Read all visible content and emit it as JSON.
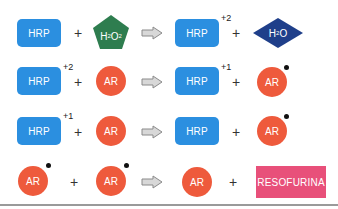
{
  "colors": {
    "hrp": "#2b8fe0",
    "ar": "#ee5a3c",
    "h2o2": "#2e7d4f",
    "h2o": "#1f3f8a",
    "resofurina": "#e8507a",
    "arrow": "#b0b0b0"
  },
  "reactions": [
    {
      "reactants": [
        {
          "type": "HRP",
          "label": "HRP",
          "charge": ""
        },
        {
          "type": "H2O2",
          "label": "H",
          "sub1": "2",
          "label2": "O",
          "sub2": "2"
        }
      ],
      "products": [
        {
          "type": "HRP",
          "label": "HRP",
          "charge": "+2"
        },
        {
          "type": "H2O",
          "label": "H",
          "sub1": "2",
          "label2": "O"
        }
      ],
      "plus": "+"
    },
    {
      "reactants": [
        {
          "type": "HRP",
          "label": "HRP",
          "charge": "+2"
        },
        {
          "type": "AR",
          "label": "AR",
          "radical": false
        }
      ],
      "products": [
        {
          "type": "HRP",
          "label": "HRP",
          "charge": "+1"
        },
        {
          "type": "AR",
          "label": "AR",
          "radical": true
        }
      ],
      "plus": "+"
    },
    {
      "reactants": [
        {
          "type": "HRP",
          "label": "HRP",
          "charge": "+1"
        },
        {
          "type": "AR",
          "label": "AR",
          "radical": false
        }
      ],
      "products": [
        {
          "type": "HRP",
          "label": "HRP",
          "charge": ""
        },
        {
          "type": "AR",
          "label": "AR",
          "radical": true
        }
      ],
      "plus": "+"
    },
    {
      "reactants": [
        {
          "type": "AR",
          "label": "AR",
          "radical": true
        },
        {
          "type": "AR",
          "label": "AR",
          "radical": true
        }
      ],
      "products": [
        {
          "type": "AR",
          "label": "AR",
          "radical": false
        },
        {
          "type": "RESOFURINA",
          "label": "RESOFURINA"
        }
      ],
      "plus": "+"
    }
  ]
}
